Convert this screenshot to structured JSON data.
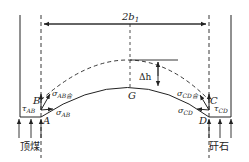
{
  "diagram": {
    "width_label": "2b",
    "width_label_sub": "1",
    "delta_h_label": "Δh",
    "points": {
      "A": "A",
      "B": "B",
      "C": "C",
      "D": "D",
      "G": "G"
    },
    "stresses": {
      "tau_ab": "τ",
      "tau_ab_sub": "AB",
      "sigma_ab_he": "σ",
      "sigma_ab_he_sub": "AB合",
      "sigma_ab": "σ",
      "sigma_ab_sub": "AB",
      "tau_cd": "τ",
      "tau_cd_sub": "CD",
      "sigma_cd_he": "σ",
      "sigma_cd_he_sub": "CD合",
      "sigma_cd": "σ",
      "sigma_cd_sub": "CD"
    },
    "left_support_label": "顶煤",
    "right_support_label": "矸石",
    "line_color": "#222222"
  }
}
